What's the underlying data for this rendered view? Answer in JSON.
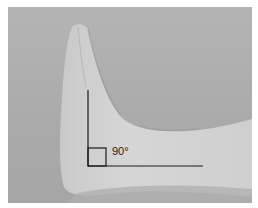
{
  "image": {
    "subject": "foot in lateral view with ankle at right angle",
    "annotation": {
      "angle_label": "90°",
      "line_color": "#1a1a1a"
    },
    "colors": {
      "background": "#aaaaaa",
      "skin": "#d2d2d2",
      "border": "#ffffff"
    }
  }
}
